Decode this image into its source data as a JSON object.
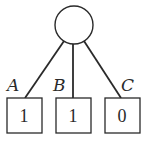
{
  "diagram": {
    "type": "tree",
    "root": {
      "shape": "circle",
      "label": ""
    },
    "children": [
      {
        "edge_label": "A",
        "value": "1"
      },
      {
        "edge_label": "B",
        "value": "1"
      },
      {
        "edge_label": "C",
        "value": "0"
      }
    ],
    "colors": {
      "stroke": "#2a2a2a",
      "background": "#ffffff"
    }
  }
}
